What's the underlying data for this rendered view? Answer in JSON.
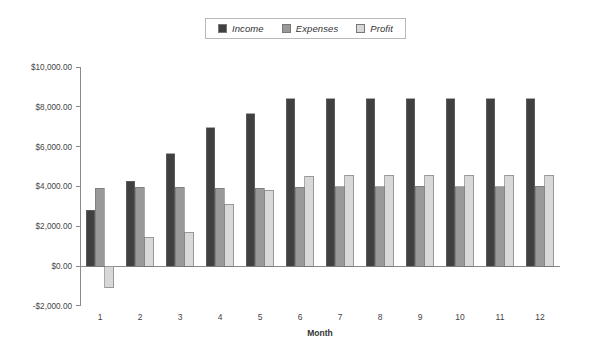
{
  "chart_data": {
    "type": "bar",
    "title": "",
    "xlabel": "Month",
    "ylabel": "",
    "categories": [
      "1",
      "2",
      "3",
      "4",
      "5",
      "6",
      "7",
      "8",
      "9",
      "10",
      "11",
      "12"
    ],
    "series": [
      {
        "name": "Income",
        "color": "#404040",
        "values": [
          2800,
          4250,
          5650,
          6950,
          7650,
          8400,
          8400,
          8400,
          8400,
          8400,
          8400,
          8400
        ]
      },
      {
        "name": "Expenses",
        "color": "#999999",
        "values": [
          3900,
          3950,
          3950,
          3900,
          3900,
          3950,
          3980,
          3980,
          4000,
          3980,
          3980,
          4000
        ]
      },
      {
        "name": "Profit",
        "color": "#d8d8d8",
        "values": [
          -1100,
          1450,
          1700,
          3100,
          3800,
          4500,
          4550,
          4550,
          4550,
          4550,
          4550,
          4550
        ]
      }
    ],
    "ylim": [
      -2000,
      10000
    ],
    "ytick_values": [
      10000,
      8000,
      6000,
      4000,
      2000,
      0,
      -2000
    ],
    "ytick_labels": [
      "$10,000.00",
      "$8,000.00",
      "$6,000.00",
      "$4,000.00",
      "$2,000.00",
      "$0.00",
      "-$2,000.00"
    ],
    "grid": false,
    "legend_position": "top-center"
  },
  "legend": {
    "entries": [
      {
        "label": "Income"
      },
      {
        "label": "Expenses"
      },
      {
        "label": "Profit"
      }
    ]
  }
}
